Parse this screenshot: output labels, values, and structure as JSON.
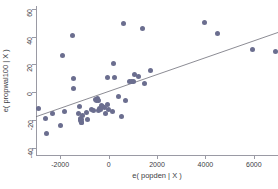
{
  "chart_data": {
    "type": "scatter",
    "title": "",
    "xlabel": "e( popden | X )",
    "ylabel": "e( propwal100 | X )",
    "xlim": [
      -3000,
      7000
    ],
    "ylim": [
      -45,
      62
    ],
    "xticks": [
      -2000,
      0,
      2000,
      4000,
      6000
    ],
    "xticklabels": [
      "-2000",
      "0",
      "2000",
      "4000",
      "6000"
    ],
    "yticks": [
      60,
      40,
      20,
      0,
      -20,
      -40
    ],
    "yticklabels": [
      "60",
      "40",
      "20",
      "0",
      "-20",
      "-40"
    ],
    "grid": false,
    "legend": null,
    "marker_color": "#6b6e8f",
    "line_color": "#6f6f78",
    "axis_color": "#9a9aa4",
    "fit_line": {
      "label": "linear fit",
      "x": [
        -3000,
        7000
      ],
      "y": [
        -17.5,
        43.0
      ]
    },
    "points": [
      {
        "x": -2900,
        "y": -11.5
      },
      {
        "x": -2620,
        "y": -19.0
      },
      {
        "x": -2560,
        "y": -29.5
      },
      {
        "x": -2320,
        "y": -15.5
      },
      {
        "x": -1980,
        "y": -23.5
      },
      {
        "x": -1900,
        "y": 26.5
      },
      {
        "x": -1840,
        "y": -14.0
      },
      {
        "x": -1480,
        "y": 41.0
      },
      {
        "x": -1460,
        "y": 10.0
      },
      {
        "x": -1440,
        "y": 3.0
      },
      {
        "x": -1240,
        "y": -15.5
      },
      {
        "x": -1220,
        "y": -10.0
      },
      {
        "x": -1180,
        "y": -18.5
      },
      {
        "x": -1160,
        "y": -20.5
      },
      {
        "x": -1140,
        "y": -21.5
      },
      {
        "x": -1120,
        "y": -19.5
      },
      {
        "x": -1100,
        "y": -22.0
      },
      {
        "x": -1060,
        "y": -16.5
      },
      {
        "x": -900,
        "y": -14.5
      },
      {
        "x": -860,
        "y": -19.5
      },
      {
        "x": -700,
        "y": -12.5
      },
      {
        "x": -620,
        "y": -13.0
      },
      {
        "x": -540,
        "y": -5.0
      },
      {
        "x": -500,
        "y": -6.0
      },
      {
        "x": -460,
        "y": -4.5
      },
      {
        "x": -420,
        "y": -5.5
      },
      {
        "x": -400,
        "y": -13.0
      },
      {
        "x": -360,
        "y": -11.5
      },
      {
        "x": -320,
        "y": -12.5
      },
      {
        "x": -300,
        "y": -9.5
      },
      {
        "x": -260,
        "y": -10.5
      },
      {
        "x": -180,
        "y": -11.0
      },
      {
        "x": -140,
        "y": -15.5
      },
      {
        "x": -60,
        "y": 10.5
      },
      {
        "x": -40,
        "y": -8.5
      },
      {
        "x": 0,
        "y": -12.0
      },
      {
        "x": 160,
        "y": -14.0
      },
      {
        "x": 220,
        "y": 20.5
      },
      {
        "x": 260,
        "y": 10.5
      },
      {
        "x": 400,
        "y": -3.0
      },
      {
        "x": 520,
        "y": -17.5
      },
      {
        "x": 620,
        "y": 49.5
      },
      {
        "x": 700,
        "y": -6.0
      },
      {
        "x": 880,
        "y": 7.5
      },
      {
        "x": 940,
        "y": 8.0
      },
      {
        "x": 1020,
        "y": 7.5
      },
      {
        "x": 1060,
        "y": 13.0
      },
      {
        "x": 1240,
        "y": 11.5
      },
      {
        "x": 1380,
        "y": 45.5
      },
      {
        "x": 1480,
        "y": 6.5
      },
      {
        "x": 1740,
        "y": 16.0
      },
      {
        "x": 3980,
        "y": 50.5
      },
      {
        "x": 4520,
        "y": 42.0
      },
      {
        "x": 5960,
        "y": 31.0
      },
      {
        "x": 6900,
        "y": 29.0
      }
    ]
  }
}
